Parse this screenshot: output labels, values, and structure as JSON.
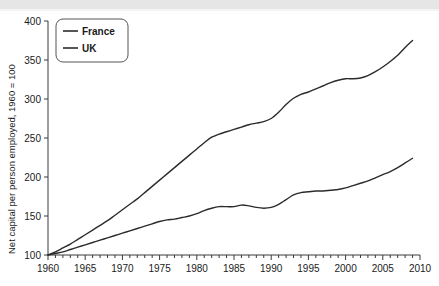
{
  "chart_data": {
    "type": "line",
    "title": "",
    "xlabel": "",
    "ylabel": "Net capital per person employed, 1960 = 100",
    "xlim": [
      1960,
      2010
    ],
    "ylim": [
      100,
      400
    ],
    "xticks": [
      1960,
      1965,
      1970,
      1975,
      1980,
      1985,
      1990,
      1995,
      2000,
      2005,
      2010
    ],
    "yticks": [
      100,
      150,
      200,
      250,
      300,
      350,
      400
    ],
    "xtick_labels": [
      "1960",
      "1965",
      "1970",
      "1975",
      "1980",
      "1985",
      "1990",
      "1995",
      "2000",
      "2005",
      "2010"
    ],
    "ytick_labels": [
      "100",
      "150",
      "200",
      "250",
      "300",
      "350",
      "400"
    ],
    "minor_xtick_interval": 1,
    "grid": false,
    "legend_position": "top-left",
    "legend": [
      "France",
      "UK"
    ],
    "x": [
      1960,
      1961,
      1962,
      1963,
      1964,
      1965,
      1966,
      1967,
      1968,
      1969,
      1970,
      1971,
      1972,
      1973,
      1974,
      1975,
      1976,
      1977,
      1978,
      1979,
      1980,
      1981,
      1982,
      1983,
      1984,
      1985,
      1986,
      1987,
      1988,
      1989,
      1990,
      1991,
      1992,
      1993,
      1994,
      1995,
      1996,
      1997,
      1998,
      1999,
      2000,
      2001,
      2002,
      2003,
      2004,
      2005,
      2006,
      2007,
      2008,
      2009
    ],
    "series": [
      {
        "name": "France",
        "color": "#2b2b2b",
        "values": [
          100,
          104,
          109,
          114,
          120,
          126,
          132,
          138,
          144,
          151,
          158,
          165,
          172,
          180,
          188,
          196,
          204,
          212,
          220,
          228,
          236,
          244,
          251,
          255,
          258,
          261,
          264,
          267,
          269,
          271,
          275,
          283,
          293,
          301,
          306,
          309,
          313,
          317,
          321,
          324,
          326,
          326,
          327,
          330,
          335,
          341,
          348,
          356,
          366,
          375
        ]
      },
      {
        "name": "UK",
        "color": "#2b2b2b",
        "values": [
          100,
          102,
          104,
          107,
          110,
          113,
          116,
          119,
          122,
          125,
          128,
          131,
          134,
          137,
          140,
          143,
          145,
          146,
          148,
          150,
          153,
          157,
          160,
          162,
          162,
          162,
          164,
          163,
          161,
          160,
          161,
          165,
          171,
          177,
          180,
          181,
          182,
          182,
          183,
          184,
          186,
          189,
          192,
          195,
          199,
          203,
          207,
          212,
          218,
          224
        ]
      }
    ]
  },
  "axes": {
    "ylabel": "Net capital per person employed, 1960 = 100"
  }
}
